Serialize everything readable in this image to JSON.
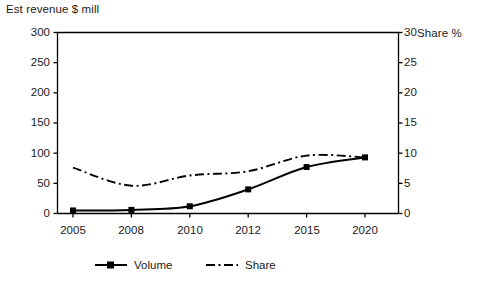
{
  "chart_data": {
    "type": "line",
    "title": "",
    "xlabel": "",
    "ylabel": "Est revenue $ mill",
    "y2label": "Share %",
    "categories": [
      "2005",
      "2008",
      "2010",
      "2012",
      "2015",
      "2020"
    ],
    "x": [
      2005,
      2008,
      2010,
      2012,
      2015,
      2020
    ],
    "ylim": [
      0,
      300
    ],
    "y2lim": [
      0,
      30
    ],
    "yticks": [
      0,
      50,
      100,
      150,
      200,
      250,
      300
    ],
    "y2ticks": [
      0,
      5,
      10,
      15,
      20,
      25,
      30
    ],
    "grid": false,
    "legend_position": "bottom",
    "series": [
      {
        "name": "Volume",
        "axis": "left",
        "style": "solid",
        "marker": "square",
        "values": [
          5,
          6,
          12,
          40,
          77,
          93
        ]
      },
      {
        "name": "Share",
        "axis": "right",
        "style": "dash-dot",
        "marker": "none",
        "values": [
          7.6,
          4.6,
          6.3,
          7.0,
          9.6,
          9.3
        ]
      }
    ]
  },
  "axes": {
    "left_title": "Est revenue $ mill",
    "right_title": "Share %",
    "left_ticks": [
      "300",
      "250",
      "200",
      "150",
      "100",
      "50",
      "0"
    ],
    "right_ticks": [
      "30",
      "25",
      "20",
      "15",
      "10",
      "5",
      "0"
    ],
    "x_ticks": [
      "2005",
      "2008",
      "2010",
      "2012",
      "2015",
      "2020"
    ]
  },
  "legend": {
    "items": [
      {
        "label": "Volume",
        "style": "solid-square"
      },
      {
        "label": "Share",
        "style": "dash-dot"
      }
    ]
  },
  "colors": {
    "line": "#000000",
    "text": "#1a1a1a",
    "background": "#ffffff"
  }
}
